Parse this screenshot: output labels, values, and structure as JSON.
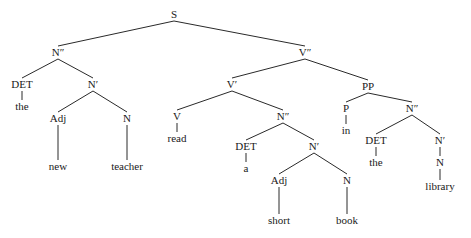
{
  "diagram": {
    "type": "syntax-tree",
    "nodes": [
      {
        "id": "S",
        "label": "S",
        "x": 174,
        "y": 18
      },
      {
        "id": "NPP1",
        "label": "N″",
        "x": 58,
        "y": 56
      },
      {
        "id": "DET1",
        "label": "DET",
        "x": 22,
        "y": 88
      },
      {
        "id": "the1",
        "label": "the",
        "x": 22,
        "y": 110
      },
      {
        "id": "NP1",
        "label": "N′",
        "x": 93,
        "y": 88
      },
      {
        "id": "Adj1",
        "label": "Adj",
        "x": 58,
        "y": 122
      },
      {
        "id": "new",
        "label": "new",
        "x": 58,
        "y": 170
      },
      {
        "id": "N1",
        "label": "N",
        "x": 127,
        "y": 122
      },
      {
        "id": "teacher",
        "label": "teacher",
        "x": 127,
        "y": 170
      },
      {
        "id": "VPP",
        "label": "V″",
        "x": 305,
        "y": 56
      },
      {
        "id": "VP",
        "label": "V′",
        "x": 232,
        "y": 88
      },
      {
        "id": "V",
        "label": "V",
        "x": 177,
        "y": 120
      },
      {
        "id": "read",
        "label": "read",
        "x": 177,
        "y": 142
      },
      {
        "id": "NPP2",
        "label": "N″",
        "x": 283,
        "y": 120
      },
      {
        "id": "DET2",
        "label": "DET",
        "x": 246,
        "y": 150
      },
      {
        "id": "a",
        "label": "a",
        "x": 246,
        "y": 172
      },
      {
        "id": "NP2",
        "label": "N′",
        "x": 314,
        "y": 150
      },
      {
        "id": "Adj2",
        "label": "Adj",
        "x": 279,
        "y": 184
      },
      {
        "id": "short",
        "label": "short",
        "x": 279,
        "y": 224
      },
      {
        "id": "N2",
        "label": "N",
        "x": 347,
        "y": 184
      },
      {
        "id": "book",
        "label": "book",
        "x": 347,
        "y": 224
      },
      {
        "id": "PP",
        "label": "PP",
        "x": 368,
        "y": 90
      },
      {
        "id": "P",
        "label": "P",
        "x": 346,
        "y": 112
      },
      {
        "id": "in",
        "label": "in",
        "x": 346,
        "y": 134
      },
      {
        "id": "NPP3",
        "label": "N″",
        "x": 412,
        "y": 112
      },
      {
        "id": "DET3",
        "label": "DET",
        "x": 376,
        "y": 144
      },
      {
        "id": "the2",
        "label": "the",
        "x": 376,
        "y": 166
      },
      {
        "id": "NP3",
        "label": "N′",
        "x": 440,
        "y": 144
      },
      {
        "id": "N3",
        "label": "N",
        "x": 440,
        "y": 166
      },
      {
        "id": "library",
        "label": "library",
        "x": 440,
        "y": 190
      }
    ],
    "edges": [
      [
        "S",
        "NPP1"
      ],
      [
        "S",
        "VPP"
      ],
      [
        "NPP1",
        "DET1"
      ],
      [
        "NPP1",
        "NP1"
      ],
      [
        "DET1",
        "the1"
      ],
      [
        "NP1",
        "Adj1"
      ],
      [
        "NP1",
        "N1"
      ],
      [
        "Adj1",
        "new"
      ],
      [
        "N1",
        "teacher"
      ],
      [
        "VPP",
        "VP"
      ],
      [
        "VPP",
        "PP"
      ],
      [
        "VP",
        "V"
      ],
      [
        "VP",
        "NPP2"
      ],
      [
        "V",
        "read"
      ],
      [
        "NPP2",
        "DET2"
      ],
      [
        "NPP2",
        "NP2"
      ],
      [
        "DET2",
        "a"
      ],
      [
        "NP2",
        "Adj2"
      ],
      [
        "NP2",
        "N2"
      ],
      [
        "Adj2",
        "short"
      ],
      [
        "N2",
        "book"
      ],
      [
        "PP",
        "P"
      ],
      [
        "PP",
        "NPP3"
      ],
      [
        "P",
        "in"
      ],
      [
        "NPP3",
        "DET3"
      ],
      [
        "NPP3",
        "NP3"
      ],
      [
        "DET3",
        "the2"
      ],
      [
        "NP3",
        "N3"
      ],
      [
        "N3",
        "library"
      ]
    ]
  }
}
